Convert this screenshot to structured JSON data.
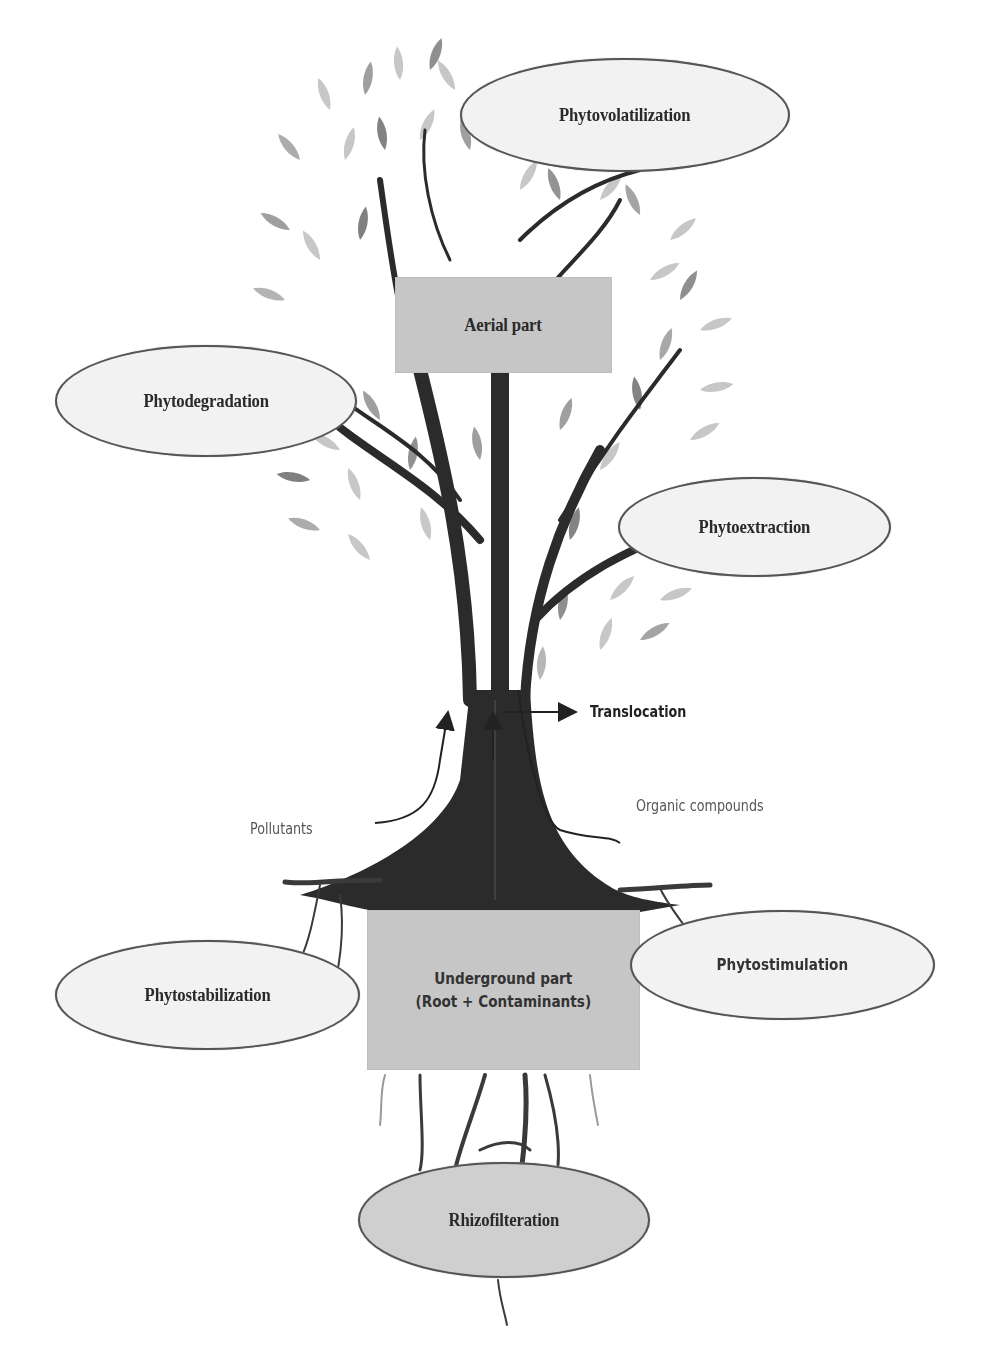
{
  "diagram": {
    "type": "phytoremediation mechanisms tree diagram",
    "central_nodes": {
      "aerial": {
        "label": "Aerial part"
      },
      "underground": {
        "line1": "Underground part",
        "line2": "(Root + Contaminants)"
      }
    },
    "mechanisms": [
      {
        "id": "phytovolatilization",
        "label": "Phytovolatilization",
        "region": "aerial"
      },
      {
        "id": "phytodegradation",
        "label": "Phytodegradation",
        "region": "aerial"
      },
      {
        "id": "phytoextraction",
        "label": "Phytoextraction",
        "region": "aerial"
      },
      {
        "id": "phytostabilization",
        "label": "Phytostabilization",
        "region": "underground"
      },
      {
        "id": "phytostimulation",
        "label": "Phytostimulation",
        "region": "underground"
      },
      {
        "id": "rhizofilteration",
        "label": "Rhizofilteration",
        "region": "underground"
      }
    ],
    "flow_labels": {
      "translocation": "Translocation",
      "pollutants": "Pollutants",
      "organic_compounds": "Organic compounds"
    },
    "colors": {
      "trunk": "#2b2b2b",
      "leaf_light": "#c4c4c4",
      "leaf_mid": "#9a9a9a",
      "leaf_dark": "#6e6e6e",
      "box_fill": "#c6c6c6",
      "ellipse_fill": "#f2f2f2",
      "ellipse_stroke": "#555555"
    }
  }
}
